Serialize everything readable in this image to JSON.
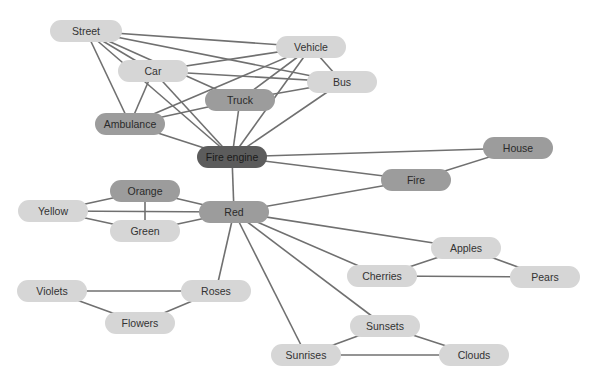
{
  "diagram": {
    "type": "concept-map",
    "colors": {
      "edge": "#707070",
      "light": "#d6d6d6",
      "medium": "#9c9c9c",
      "dark": "#5c5c5c"
    },
    "nodes": [
      {
        "id": "street",
        "label": "Street",
        "x": 86,
        "y": 31,
        "w": 72,
        "shade": "light"
      },
      {
        "id": "vehicle",
        "label": "Vehicle",
        "x": 311,
        "y": 47,
        "w": 70,
        "shade": "light"
      },
      {
        "id": "car",
        "label": "Car",
        "x": 153,
        "y": 71,
        "w": 70,
        "shade": "light"
      },
      {
        "id": "bus",
        "label": "Bus",
        "x": 342,
        "y": 82,
        "w": 70,
        "shade": "light"
      },
      {
        "id": "truck",
        "label": "Truck",
        "x": 240,
        "y": 100,
        "w": 70,
        "shade": "medium"
      },
      {
        "id": "ambulance",
        "label": "Ambulance",
        "x": 130,
        "y": 124,
        "w": 70,
        "shade": "medium"
      },
      {
        "id": "fire_engine",
        "label": "Fire engine",
        "x": 232,
        "y": 157,
        "w": 70,
        "shade": "dark"
      },
      {
        "id": "house",
        "label": "House",
        "x": 518,
        "y": 148,
        "w": 70,
        "shade": "medium"
      },
      {
        "id": "fire",
        "label": "Fire",
        "x": 416,
        "y": 180,
        "w": 70,
        "shade": "medium"
      },
      {
        "id": "orange",
        "label": "Orange",
        "x": 145,
        "y": 191,
        "w": 70,
        "shade": "medium"
      },
      {
        "id": "yellow",
        "label": "Yellow",
        "x": 53,
        "y": 211,
        "w": 70,
        "shade": "light"
      },
      {
        "id": "red",
        "label": "Red",
        "x": 234,
        "y": 212,
        "w": 70,
        "shade": "medium"
      },
      {
        "id": "green",
        "label": "Green",
        "x": 145,
        "y": 231,
        "w": 70,
        "shade": "light"
      },
      {
        "id": "apples",
        "label": "Apples",
        "x": 466,
        "y": 248,
        "w": 70,
        "shade": "light"
      },
      {
        "id": "cherries",
        "label": "Cherries",
        "x": 382,
        "y": 276,
        "w": 70,
        "shade": "light"
      },
      {
        "id": "pears",
        "label": "Pears",
        "x": 545,
        "y": 277,
        "w": 70,
        "shade": "light"
      },
      {
        "id": "violets",
        "label": "Violets",
        "x": 52,
        "y": 291,
        "w": 70,
        "shade": "light"
      },
      {
        "id": "roses",
        "label": "Roses",
        "x": 216,
        "y": 291,
        "w": 70,
        "shade": "light"
      },
      {
        "id": "flowers",
        "label": "Flowers",
        "x": 140,
        "y": 323,
        "w": 70,
        "shade": "light"
      },
      {
        "id": "sunsets",
        "label": "Sunsets",
        "x": 385,
        "y": 326,
        "w": 70,
        "shade": "light"
      },
      {
        "id": "sunrises",
        "label": "Sunrises",
        "x": 306,
        "y": 355,
        "w": 70,
        "shade": "light"
      },
      {
        "id": "clouds",
        "label": "Clouds",
        "x": 474,
        "y": 355,
        "w": 70,
        "shade": "light"
      }
    ],
    "edges": [
      [
        "street",
        "vehicle"
      ],
      [
        "street",
        "bus"
      ],
      [
        "street",
        "truck"
      ],
      [
        "street",
        "car"
      ],
      [
        "street",
        "ambulance"
      ],
      [
        "street",
        "fire_engine"
      ],
      [
        "vehicle",
        "car"
      ],
      [
        "vehicle",
        "ambulance"
      ],
      [
        "vehicle",
        "truck"
      ],
      [
        "vehicle",
        "fire_engine"
      ],
      [
        "vehicle",
        "bus"
      ],
      [
        "car",
        "bus"
      ],
      [
        "car",
        "ambulance"
      ],
      [
        "car",
        "fire_engine"
      ],
      [
        "bus",
        "truck"
      ],
      [
        "bus",
        "fire_engine"
      ],
      [
        "truck",
        "ambulance"
      ],
      [
        "truck",
        "fire_engine"
      ],
      [
        "ambulance",
        "fire_engine"
      ],
      [
        "fire_engine",
        "house"
      ],
      [
        "fire_engine",
        "fire"
      ],
      [
        "fire_engine",
        "red"
      ],
      [
        "house",
        "fire"
      ],
      [
        "fire",
        "red"
      ],
      [
        "red",
        "orange"
      ],
      [
        "red",
        "yellow"
      ],
      [
        "red",
        "green"
      ],
      [
        "orange",
        "yellow"
      ],
      [
        "orange",
        "green"
      ],
      [
        "yellow",
        "green"
      ],
      [
        "red",
        "apples"
      ],
      [
        "red",
        "cherries"
      ],
      [
        "red",
        "sunsets"
      ],
      [
        "red",
        "sunrises"
      ],
      [
        "red",
        "roses"
      ],
      [
        "apples",
        "cherries"
      ],
      [
        "apples",
        "pears"
      ],
      [
        "cherries",
        "pears"
      ],
      [
        "violets",
        "roses"
      ],
      [
        "violets",
        "flowers"
      ],
      [
        "roses",
        "flowers"
      ],
      [
        "sunsets",
        "sunrises"
      ],
      [
        "sunsets",
        "clouds"
      ],
      [
        "sunrises",
        "clouds"
      ]
    ]
  }
}
